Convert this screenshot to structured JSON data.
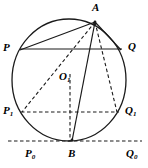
{
  "figure": {
    "type": "geometry-diagram",
    "width": 148,
    "height": 168,
    "stroke_color": "#1a1a1a",
    "background_color": "#ffffff"
  },
  "circle": {
    "name": "main-circle",
    "center_x": 69,
    "center_y": 80,
    "radius_x": 57,
    "radius_y": 61,
    "style": "solid"
  },
  "points": [
    {
      "id": "A",
      "label": "A",
      "sub": "",
      "x": 95,
      "y": 22,
      "label_x": 92,
      "label_y": 2
    },
    {
      "id": "P",
      "label": "P",
      "sub": "",
      "x": 20,
      "y": 50,
      "label_x": 3,
      "label_y": 42
    },
    {
      "id": "Q",
      "label": "Q",
      "sub": "",
      "x": 120,
      "y": 50,
      "label_x": 128,
      "label_y": 41
    },
    {
      "id": "O1",
      "label": "O",
      "sub": "1",
      "x": 69,
      "y": 80,
      "label_x": 59,
      "label_y": 71
    },
    {
      "id": "P1",
      "label": "P",
      "sub": "1",
      "x": 22,
      "y": 112,
      "label_x": 3,
      "label_y": 105
    },
    {
      "id": "Q1",
      "label": "Q",
      "sub": "1",
      "x": 117,
      "y": 112,
      "label_x": 125,
      "label_y": 105
    },
    {
      "id": "B",
      "label": "B",
      "sub": "",
      "x": 72,
      "y": 140,
      "label_x": 68,
      "label_y": 148
    },
    {
      "id": "P0",
      "label": "P",
      "sub": "0",
      "x": 12,
      "y": 141,
      "label_x": 25,
      "label_y": 148
    },
    {
      "id": "Q0",
      "label": "Q",
      "sub": "0",
      "x": 136,
      "y": 141,
      "label_x": 126,
      "label_y": 148
    }
  ],
  "segments": [
    {
      "name": "chord-A-P",
      "from": "A",
      "to": "P",
      "style": "solid",
      "x1": 95,
      "y1": 22,
      "x2": 20,
      "y2": 50
    },
    {
      "name": "chord-A-Q",
      "from": "A",
      "to": "Q",
      "style": "solid",
      "x1": 95,
      "y1": 22,
      "x2": 121,
      "y2": 50
    },
    {
      "name": "chord-P-Q",
      "from": "P",
      "to": "Q",
      "style": "solid",
      "x1": 20,
      "y1": 49,
      "x2": 122,
      "y2": 49
    },
    {
      "name": "chord-A-B",
      "from": "A",
      "to": "B",
      "style": "solid",
      "x1": 95,
      "y1": 22,
      "x2": 72,
      "y2": 141
    },
    {
      "name": "chord-A-P1",
      "from": "A",
      "to": "P1",
      "style": "dashed",
      "x1": 95,
      "y1": 22,
      "x2": 22,
      "y2": 112
    },
    {
      "name": "chord-A-Q1",
      "from": "A",
      "to": "Q1",
      "style": "dashed",
      "x1": 95,
      "y1": 22,
      "x2": 117,
      "y2": 112
    },
    {
      "name": "chord-P1-Q1",
      "from": "P1",
      "to": "Q1",
      "style": "dashed",
      "x1": 21,
      "y1": 112,
      "x2": 119,
      "y2": 112
    },
    {
      "name": "radius-O1-B",
      "from": "O1",
      "to": "B",
      "style": "dashed",
      "x1": 70,
      "y1": 74,
      "x2": 70,
      "y2": 141
    },
    {
      "name": "tangent-line-P0Q0",
      "from": "P0",
      "to": "Q0",
      "style": "dashed",
      "x1": 8,
      "y1": 141,
      "x2": 142,
      "y2": 141
    }
  ]
}
